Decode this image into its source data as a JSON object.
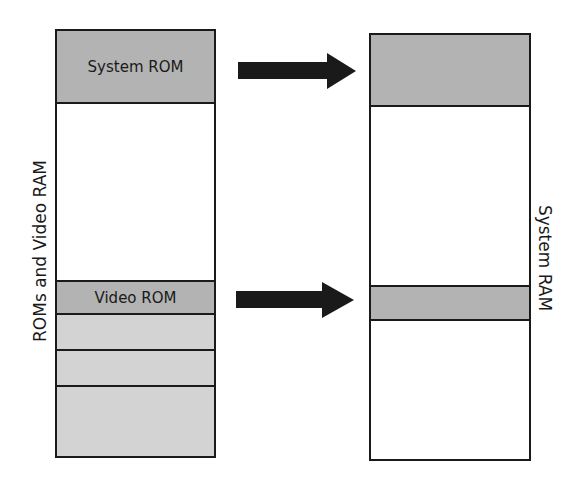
{
  "diagram": {
    "type": "memory-shadowing",
    "colors": {
      "outline": "#1a1a1a",
      "rom_fill": "#b3b3b3",
      "light_fill": "#d3d3d3",
      "empty_fill": "#ffffff",
      "arrow": "#1a1a1a"
    },
    "left_column": {
      "label": "ROMs and Video RAM",
      "segments": [
        {
          "label": "System ROM",
          "fill": "rom"
        },
        {
          "label": "",
          "fill": "empty"
        },
        {
          "label": "Video ROM",
          "fill": "rom"
        },
        {
          "label": "",
          "fill": "light"
        },
        {
          "label": "",
          "fill": "light"
        },
        {
          "label": "",
          "fill": "light"
        }
      ]
    },
    "right_column": {
      "label": "System RAM",
      "segments": [
        {
          "label": "",
          "fill": "rom"
        },
        {
          "label": "",
          "fill": "empty"
        },
        {
          "label": "",
          "fill": "rom"
        },
        {
          "label": "",
          "fill": "empty"
        }
      ]
    },
    "arrows": [
      {
        "from": "System ROM",
        "to": "System RAM shadow region (top)"
      },
      {
        "from": "Video ROM",
        "to": "System RAM shadow region (middle)"
      }
    ]
  }
}
